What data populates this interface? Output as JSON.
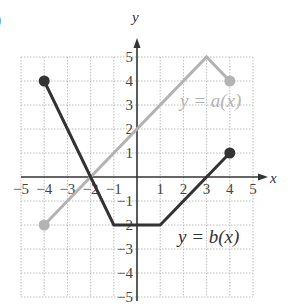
{
  "panel_label": ")",
  "chart_data": {
    "type": "line",
    "title": "",
    "xlabel": "x",
    "ylabel": "y",
    "xlim": [
      -5,
      5
    ],
    "ylim": [
      -5,
      5
    ],
    "grid": true,
    "grid_style": "dotted",
    "x_ticks": [
      -5,
      -4,
      -3,
      -2,
      -1,
      1,
      2,
      3,
      4,
      5
    ],
    "y_ticks": [
      -5,
      -4,
      -3,
      -2,
      -1,
      1,
      2,
      3,
      4,
      5
    ],
    "x_tick_labels": [
      "−5",
      "−4",
      "−3",
      "−2",
      "−1",
      "1",
      "2",
      "3",
      "4",
      "5"
    ],
    "y_tick_labels": [
      "−5",
      "−4",
      "−3",
      "−2",
      "−1",
      "1",
      "2",
      "3",
      "4",
      "5"
    ],
    "series": [
      {
        "name": "y = a(x)",
        "color": "#b3b3b3",
        "points": [
          [
            -4,
            -2
          ],
          [
            3,
            5
          ],
          [
            4,
            4
          ]
        ],
        "endpoints": "closed"
      },
      {
        "name": "y = b(x)",
        "color": "#333333",
        "points": [
          [
            -4,
            4
          ],
          [
            -1,
            -2
          ],
          [
            1,
            -2
          ],
          [
            4,
            1
          ]
        ],
        "endpoints": "closed"
      }
    ],
    "annotations": [
      {
        "text": "y = a(x)",
        "at": [
          3.0,
          3.0
        ]
      },
      {
        "text": "y = b(x)",
        "at": [
          3.0,
          -2.5
        ]
      }
    ]
  },
  "labels": {
    "x_axis": "x",
    "y_axis": "y",
    "a_label": "y = a(x)",
    "b_label": "y = b(x)"
  },
  "colors": {
    "grid": "#bdbdbd",
    "axis": "#333333",
    "a_series": "#b3b3b3",
    "b_series": "#333333"
  }
}
